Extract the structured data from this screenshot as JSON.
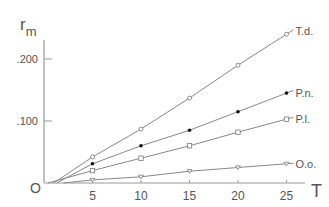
{
  "chart_data": {
    "type": "line",
    "title": "",
    "xlabel": "T",
    "ylabel": "r_m",
    "ylabel_main": "r",
    "ylabel_sub": "m",
    "origin_label": "O",
    "xlim": [
      0,
      27
    ],
    "ylim": [
      0,
      0.25
    ],
    "x_ticks": [
      5,
      10,
      15,
      20,
      25
    ],
    "x_tick_labels": [
      "5",
      "10",
      "15",
      "20",
      "25"
    ],
    "y_ticks": [
      0.1,
      0.2
    ],
    "y_tick_labels": [
      ".100",
      ".200"
    ],
    "grid": false,
    "legend": "inline labels at line ends",
    "x": [
      5,
      10,
      15,
      20,
      25
    ],
    "series": [
      {
        "name": "T.d.",
        "marker": "open-circle",
        "values": [
          0.042,
          0.087,
          0.137,
          0.19,
          0.24
        ],
        "line_start_x": 1.0
      },
      {
        "name": "P.n.",
        "marker": "filled-circle",
        "values": [
          0.031,
          0.06,
          0.085,
          0.115,
          0.145
        ],
        "line_start_x": 1.3
      },
      {
        "name": "P.l.",
        "marker": "open-square",
        "values": [
          0.02,
          0.04,
          0.06,
          0.082,
          0.103
        ],
        "line_start_x": 0.4
      },
      {
        "name": "O.o.",
        "marker": "open-triangle",
        "values": [
          0.005,
          0.01,
          0.019,
          0.025,
          0.031
        ],
        "line_start_x": 2.0
      }
    ]
  }
}
